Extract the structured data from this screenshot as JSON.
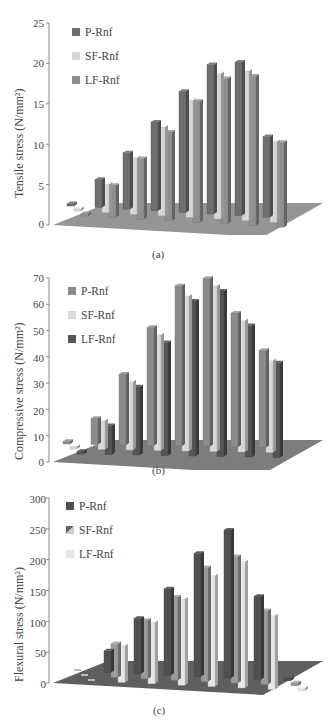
{
  "chart_data": [
    {
      "id": "a",
      "type": "bar",
      "subtype": "3d-clustered",
      "caption": "(a)",
      "title": "",
      "xlabel": "",
      "ylabel": "Tensile stress (N/mm²)",
      "ylim": [
        0,
        25
      ],
      "yticks": [
        "0",
        "5",
        "10",
        "15",
        "20",
        "25"
      ],
      "grid": false,
      "legend_position": "upper-left",
      "categories": [
        "1",
        "2",
        "3",
        "4",
        "5",
        "6",
        "7",
        "8"
      ],
      "series": [
        {
          "name": "P-Rnf",
          "color": "#6e6e6e",
          "values": [
            0.3,
            3.5,
            7,
            11,
            15,
            18.5,
            19,
            10
          ]
        },
        {
          "name": "SF-Rnf",
          "color": "#d6d6d6",
          "values": [
            0.3,
            3.5,
            7,
            11,
            14.5,
            18,
            18.5,
            10
          ]
        },
        {
          "name": "LF-Rnf",
          "color": "#8f8f8f",
          "values": [
            0.3,
            4,
            7.5,
            11,
            15,
            18,
            18.5,
            10.5
          ]
        }
      ]
    },
    {
      "id": "b",
      "type": "bar",
      "subtype": "3d-clustered",
      "caption": "(b)",
      "title": "",
      "xlabel": "",
      "ylabel": "Compressive stress (N/mm²)",
      "ylim": [
        0,
        70
      ],
      "yticks": [
        "0",
        "10",
        "20",
        "30",
        "40",
        "50",
        "60",
        "70"
      ],
      "grid": false,
      "legend_position": "upper-left",
      "categories": [
        "1",
        "2",
        "3",
        "4",
        "5",
        "6",
        "7",
        "8"
      ],
      "series": [
        {
          "name": "P-Rnf",
          "color": "#8c8c8c",
          "values": [
            1,
            10,
            27,
            45,
            61,
            64,
            51,
            37
          ]
        },
        {
          "name": "SF-Rnf",
          "color": "#d8d8d8",
          "values": [
            1,
            11,
            26,
            44,
            59,
            63,
            50,
            35
          ]
        },
        {
          "name": "LF-Rnf",
          "color": "#555555",
          "values": [
            1,
            11,
            26,
            43,
            59,
            63,
            50,
            36
          ]
        }
      ]
    },
    {
      "id": "c",
      "type": "bar",
      "subtype": "3d-clustered",
      "caption": "(c)",
      "title": "",
      "xlabel": "",
      "ylabel": "Flexural stress (N/mm²)",
      "ylim": [
        0,
        300
      ],
      "yticks": [
        "0",
        "50",
        "100",
        "150",
        "200",
        "250",
        "300"
      ],
      "grid": false,
      "legend_position": "upper-left",
      "categories": [
        "1",
        "2",
        "3",
        "4",
        "5",
        "6",
        "7",
        "8"
      ],
      "series": [
        {
          "name": "P-Rnf",
          "color": "#505050",
          "values": [
            2,
            35,
            90,
            140,
            200,
            240,
            135,
            5
          ]
        },
        {
          "name": "SF-Rnf",
          "color": "#9a9a9a",
          "values": [
            2,
            55,
            95,
            135,
            185,
            205,
            120,
            5
          ]
        },
        {
          "name": "LF-Rnf",
          "color": "#e6e6e6",
          "values": [
            2,
            60,
            100,
            140,
            180,
            205,
            120,
            5
          ]
        }
      ]
    }
  ],
  "panels": {
    "a": {
      "caption": "(a)",
      "ylabel": "Tensile stress (N/mm²)",
      "ticks": [
        "25",
        "20",
        "15",
        "10",
        "5",
        "0"
      ],
      "legend": [
        "P-Rnf",
        "SF-Rnf",
        "LF-Rnf"
      ]
    },
    "b": {
      "caption": "(b)",
      "ylabel": "Compressive stress (N/mm²)",
      "ticks": [
        "70",
        "60",
        "50",
        "40",
        "30",
        "20",
        "10",
        "0"
      ],
      "legend": [
        "P-Rnf",
        "SF-Rnf",
        "LF-Rnf"
      ]
    },
    "c": {
      "caption": "(c)",
      "ylabel": "Flexural stress (N/mm²)",
      "ticks": [
        "300",
        "250",
        "200",
        "150",
        "100",
        "50",
        "0"
      ],
      "legend": [
        "P-Rnf",
        "SF-Rnf",
        "LF-Rnf"
      ]
    }
  }
}
